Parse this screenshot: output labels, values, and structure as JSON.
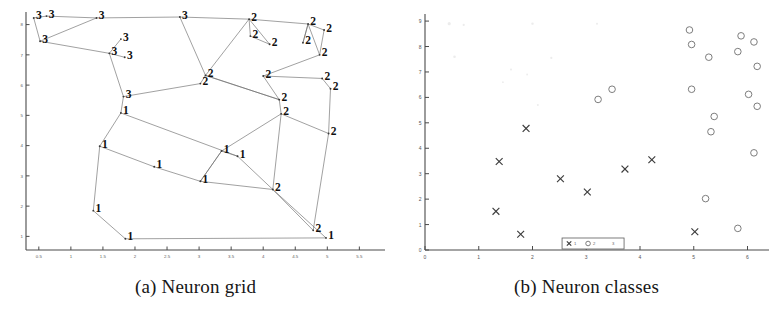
{
  "figure": {
    "panels": [
      {
        "id": "a",
        "caption": "(a) Neuron grid"
      },
      {
        "id": "b",
        "caption": "(b) Neuron classes"
      }
    ]
  },
  "chart_data": [
    {
      "type": "scatter",
      "panel": "a",
      "title": "(a) Neuron grid",
      "xlabel": "",
      "ylabel": "",
      "xlim": [
        0.3,
        5.9
      ],
      "ylim": [
        0.55,
        8.35
      ],
      "grid": false,
      "legend": "none",
      "xticks": [
        0.5,
        1,
        1.5,
        2,
        2.5,
        3,
        3.5,
        4,
        4.5,
        5,
        5.5
      ],
      "xticklabels": [
        "0.5",
        "1",
        "1.5",
        "2",
        "2.5",
        "3",
        "3.5",
        "4",
        "4.5",
        "5",
        "5.5"
      ],
      "yticks": [
        1,
        2,
        3,
        4,
        5,
        6,
        7,
        8
      ],
      "yticklabels": [
        "1",
        "2",
        "3",
        "4",
        "5",
        "6",
        "7",
        "8"
      ],
      "description": "Self-organizing map neuron grid: nodes labelled by class (1, 2 or 3) connected by grid edges",
      "nodes": [
        {
          "id": 0,
          "x": 0.42,
          "y": 8.22,
          "label": "3"
        },
        {
          "id": 1,
          "x": 0.62,
          "y": 8.28,
          "label": "3"
        },
        {
          "id": 2,
          "x": 1.4,
          "y": 8.22,
          "label": "3"
        },
        {
          "id": 3,
          "x": 0.52,
          "y": 7.45,
          "label": "3"
        },
        {
          "id": 4,
          "x": 1.6,
          "y": 7.05,
          "label": "3"
        },
        {
          "id": 5,
          "x": 1.78,
          "y": 7.52,
          "label": "3"
        },
        {
          "id": 6,
          "x": 1.84,
          "y": 6.92,
          "label": "3"
        },
        {
          "id": 7,
          "x": 1.82,
          "y": 5.62,
          "label": "3"
        },
        {
          "id": 8,
          "x": 2.7,
          "y": 8.25,
          "label": "3"
        },
        {
          "id": 9,
          "x": 3.78,
          "y": 8.18,
          "label": "2"
        },
        {
          "id": 10,
          "x": 3.8,
          "y": 7.62,
          "label": "2"
        },
        {
          "id": 11,
          "x": 4.1,
          "y": 7.35,
          "label": "2"
        },
        {
          "id": 12,
          "x": 4.7,
          "y": 8.02,
          "label": "2"
        },
        {
          "id": 13,
          "x": 4.95,
          "y": 7.82,
          "label": "2"
        },
        {
          "id": 14,
          "x": 4.62,
          "y": 7.4,
          "label": "2"
        },
        {
          "id": 15,
          "x": 4.88,
          "y": 7.0,
          "label": "2"
        },
        {
          "id": 16,
          "x": 3.1,
          "y": 6.32,
          "label": "2"
        },
        {
          "id": 17,
          "x": 3.02,
          "y": 6.05,
          "label": "2"
        },
        {
          "id": 18,
          "x": 4.0,
          "y": 6.3,
          "label": "2"
        },
        {
          "id": 19,
          "x": 4.92,
          "y": 6.22,
          "label": "2"
        },
        {
          "id": 20,
          "x": 5.05,
          "y": 5.88,
          "label": "2"
        },
        {
          "id": 21,
          "x": 4.25,
          "y": 5.52,
          "label": "2"
        },
        {
          "id": 22,
          "x": 4.28,
          "y": 5.05,
          "label": "2"
        },
        {
          "id": 23,
          "x": 5.02,
          "y": 4.4,
          "label": "2"
        },
        {
          "id": 24,
          "x": 4.15,
          "y": 2.55,
          "label": "2"
        },
        {
          "id": 25,
          "x": 4.78,
          "y": 1.2,
          "label": "2"
        },
        {
          "id": 26,
          "x": 1.78,
          "y": 5.08,
          "label": "1"
        },
        {
          "id": 27,
          "x": 1.45,
          "y": 3.98,
          "label": "1"
        },
        {
          "id": 28,
          "x": 2.3,
          "y": 3.3,
          "label": "1"
        },
        {
          "id": 29,
          "x": 3.02,
          "y": 2.82,
          "label": "1"
        },
        {
          "id": 30,
          "x": 3.35,
          "y": 3.82,
          "label": "1"
        },
        {
          "id": 31,
          "x": 3.6,
          "y": 3.65,
          "label": "1"
        },
        {
          "id": 32,
          "x": 1.35,
          "y": 1.85,
          "label": "1"
        },
        {
          "id": 33,
          "x": 1.85,
          "y": 0.92,
          "label": "1"
        },
        {
          "id": 34,
          "x": 4.98,
          "y": 0.95,
          "label": "1"
        }
      ]
    },
    {
      "type": "scatter",
      "panel": "b",
      "title": "(b) Neuron classes",
      "xlabel": "",
      "ylabel": "",
      "xlim": [
        0,
        6.4
      ],
      "ylim": [
        0,
        9.2
      ],
      "grid": false,
      "legend": "bottom-center",
      "xticks": [
        0,
        1,
        2,
        3,
        4,
        5,
        6
      ],
      "xticklabels": [
        "0",
        "1",
        "2",
        "3",
        "4",
        "5",
        "6"
      ],
      "yticks": [
        0,
        1,
        2,
        3,
        4,
        5,
        6,
        7,
        8,
        9
      ],
      "yticklabels": [
        "0",
        "1",
        "2",
        "3",
        "4",
        "5",
        "6",
        "7",
        "8",
        "9"
      ],
      "description": "Neuron class assignment scatter: class 1 drawn as crosses, class 2 drawn as open circles",
      "series": [
        {
          "name": "1",
          "marker": "x",
          "points": [
            {
              "x": 1.88,
              "y": 4.78
            },
            {
              "x": 1.38,
              "y": 3.48
            },
            {
              "x": 2.52,
              "y": 2.8
            },
            {
              "x": 3.02,
              "y": 2.28
            },
            {
              "x": 3.72,
              "y": 3.18
            },
            {
              "x": 4.22,
              "y": 3.55
            },
            {
              "x": 1.32,
              "y": 1.52
            },
            {
              "x": 1.78,
              "y": 0.62
            },
            {
              "x": 5.02,
              "y": 0.72
            }
          ]
        },
        {
          "name": "2",
          "marker": "o",
          "points": [
            {
              "x": 4.92,
              "y": 8.65
            },
            {
              "x": 4.96,
              "y": 8.08
            },
            {
              "x": 5.28,
              "y": 7.58
            },
            {
              "x": 5.88,
              "y": 8.42
            },
            {
              "x": 6.12,
              "y": 8.18
            },
            {
              "x": 5.82,
              "y": 7.8
            },
            {
              "x": 6.18,
              "y": 7.22
            },
            {
              "x": 3.48,
              "y": 6.32
            },
            {
              "x": 3.22,
              "y": 5.92
            },
            {
              "x": 4.96,
              "y": 6.32
            },
            {
              "x": 6.02,
              "y": 6.12
            },
            {
              "x": 6.18,
              "y": 5.65
            },
            {
              "x": 5.38,
              "y": 5.25
            },
            {
              "x": 5.32,
              "y": 4.65
            },
            {
              "x": 6.12,
              "y": 3.82
            },
            {
              "x": 5.22,
              "y": 2.02
            },
            {
              "x": 5.82,
              "y": 0.85
            }
          ]
        }
      ],
      "legend_entries": [
        {
          "marker": "x",
          "label": "1"
        },
        {
          "marker": "o",
          "label": "2"
        },
        {
          "marker": "none",
          "label": "3"
        }
      ]
    }
  ]
}
